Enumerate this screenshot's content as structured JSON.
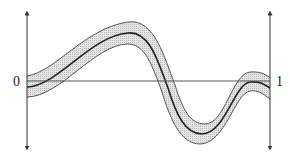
{
  "diagram": {
    "left_label": "0",
    "right_label": "1",
    "colors": {
      "stroke": "#333333",
      "band_fill": "#d9d9d9",
      "axis": "#444444",
      "background": "#ffffff"
    },
    "elements": [
      "left vertical axis with arrows",
      "right vertical axis with arrows",
      "horizontal baseline",
      "shaded band (upper and lower boundary)",
      "center curve"
    ]
  }
}
